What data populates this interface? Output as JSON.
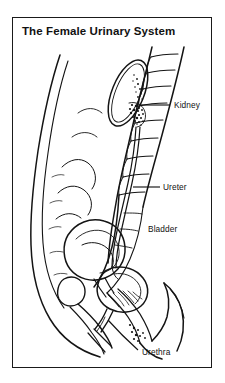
{
  "figure": {
    "title": "The Female Urinary System",
    "frame": {
      "border_color": "#1a1a1a",
      "background_color": "#ffffff"
    },
    "illustration": {
      "style": "black-and-white line drawing",
      "view": "sagittal (side) section of the female pelvis and abdomen",
      "ink_color": "#141414"
    },
    "labels": [
      {
        "name": "kidney",
        "text": "Kidney",
        "leader": "horizontal line to the right of the kidney"
      },
      {
        "name": "ureter",
        "text": "Ureter",
        "leader": "horizontal line to the right of the ureter"
      },
      {
        "name": "bladder",
        "text": "Bladder",
        "leader": "none"
      },
      {
        "name": "urethra",
        "text": "Urethra",
        "leader": "curved line rising up-left to the urethra"
      }
    ]
  }
}
